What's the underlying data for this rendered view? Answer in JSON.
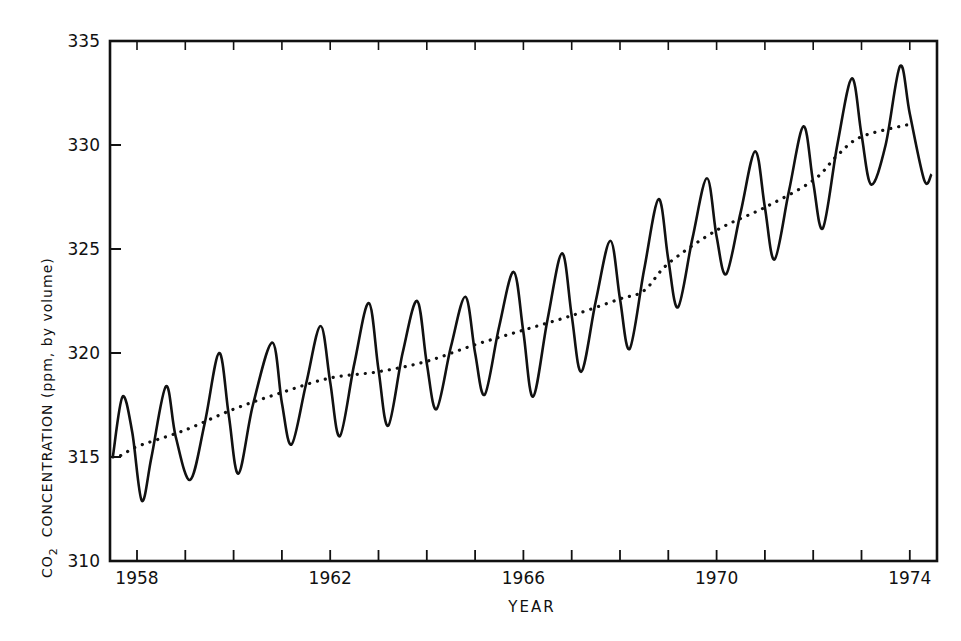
{
  "chart_data": {
    "type": "line",
    "title": "",
    "xlabel": "YEAR",
    "ylabel": "CO2 CONCENTRATION (ppm, by volume)",
    "ylabel_parts": {
      "co": "CO",
      "sub": "2",
      "rest": "CONCENTRATION  (ppm, by volume)"
    },
    "xlim": [
      1957.5,
      1974.8
    ],
    "ylim": [
      310,
      335
    ],
    "x_tick_labels": [
      "1958",
      "1962",
      "1966",
      "1970",
      "1974"
    ],
    "x_tick_values": [
      1958,
      1962,
      1966,
      1970,
      1974
    ],
    "x_minor_ticks_per_year": 2,
    "y_tick_labels": [
      "310",
      "315",
      "320",
      "325",
      "330",
      "335"
    ],
    "y_tick_values": [
      310,
      315,
      320,
      325,
      330,
      335
    ],
    "grid": false,
    "legend": null,
    "series": [
      {
        "name": "Monthly CO2 (seasonal cycle)",
        "style": "solid",
        "points": [
          [
            1957.5,
            315.0
          ],
          [
            1957.7,
            317.9
          ],
          [
            1957.9,
            316.2
          ],
          [
            1958.1,
            312.9
          ],
          [
            1958.3,
            315.0
          ],
          [
            1958.6,
            318.4
          ],
          [
            1958.8,
            316.0
          ],
          [
            1959.1,
            313.9
          ],
          [
            1959.4,
            316.6
          ],
          [
            1959.7,
            320.0
          ],
          [
            1959.9,
            317.0
          ],
          [
            1960.1,
            314.2
          ],
          [
            1960.4,
            317.5
          ],
          [
            1960.8,
            320.5
          ],
          [
            1961.0,
            317.6
          ],
          [
            1961.2,
            315.6
          ],
          [
            1961.5,
            318.5
          ],
          [
            1961.8,
            321.3
          ],
          [
            1962.0,
            318.6
          ],
          [
            1962.2,
            316.0
          ],
          [
            1962.5,
            319.5
          ],
          [
            1962.8,
            322.4
          ],
          [
            1963.0,
            319.2
          ],
          [
            1963.2,
            316.5
          ],
          [
            1963.5,
            320.0
          ],
          [
            1963.8,
            322.5
          ],
          [
            1964.0,
            319.5
          ],
          [
            1964.2,
            317.3
          ],
          [
            1964.5,
            320.3
          ],
          [
            1964.8,
            322.7
          ],
          [
            1965.0,
            320.0
          ],
          [
            1965.2,
            318.0
          ],
          [
            1965.5,
            321.3
          ],
          [
            1965.8,
            323.9
          ],
          [
            1966.0,
            321.0
          ],
          [
            1966.2,
            317.9
          ],
          [
            1966.5,
            321.6
          ],
          [
            1966.8,
            324.8
          ],
          [
            1967.0,
            321.8
          ],
          [
            1967.2,
            319.1
          ],
          [
            1967.5,
            322.5
          ],
          [
            1967.8,
            325.4
          ],
          [
            1968.0,
            322.6
          ],
          [
            1968.2,
            320.2
          ],
          [
            1968.5,
            324.0
          ],
          [
            1968.8,
            327.4
          ],
          [
            1969.0,
            324.5
          ],
          [
            1969.2,
            322.2
          ],
          [
            1969.5,
            325.5
          ],
          [
            1969.8,
            328.4
          ],
          [
            1970.0,
            325.6
          ],
          [
            1970.2,
            323.8
          ],
          [
            1970.5,
            326.8
          ],
          [
            1970.8,
            329.7
          ],
          [
            1971.0,
            327.0
          ],
          [
            1971.2,
            324.5
          ],
          [
            1971.5,
            327.8
          ],
          [
            1971.8,
            330.9
          ],
          [
            1972.0,
            328.2
          ],
          [
            1972.2,
            326.0
          ],
          [
            1972.5,
            330.0
          ],
          [
            1972.8,
            333.2
          ],
          [
            1973.0,
            330.5
          ],
          [
            1973.2,
            328.1
          ],
          [
            1973.5,
            330.0
          ],
          [
            1973.8,
            333.8
          ],
          [
            1974.0,
            331.5
          ],
          [
            1974.3,
            328.3
          ],
          [
            1974.45,
            328.6
          ]
        ]
      },
      {
        "name": "Long-term trend",
        "style": "dotted",
        "points": [
          [
            1957.5,
            315.0
          ],
          [
            1957.7,
            315.1
          ],
          [
            1958.0,
            315.5
          ],
          [
            1959.0,
            316.3
          ],
          [
            1960.0,
            317.3
          ],
          [
            1961.0,
            318.1
          ],
          [
            1962.0,
            318.8
          ],
          [
            1963.0,
            319.1
          ],
          [
            1964.0,
            319.6
          ],
          [
            1965.0,
            320.4
          ],
          [
            1966.0,
            321.1
          ],
          [
            1967.0,
            321.8
          ],
          [
            1968.0,
            322.6
          ],
          [
            1968.5,
            323.0
          ],
          [
            1969.0,
            324.3
          ],
          [
            1970.0,
            325.9
          ],
          [
            1971.0,
            327.0
          ],
          [
            1972.0,
            328.3
          ],
          [
            1972.5,
            329.5
          ],
          [
            1973.0,
            330.4
          ],
          [
            1974.0,
            331.0
          ]
        ]
      }
    ]
  }
}
